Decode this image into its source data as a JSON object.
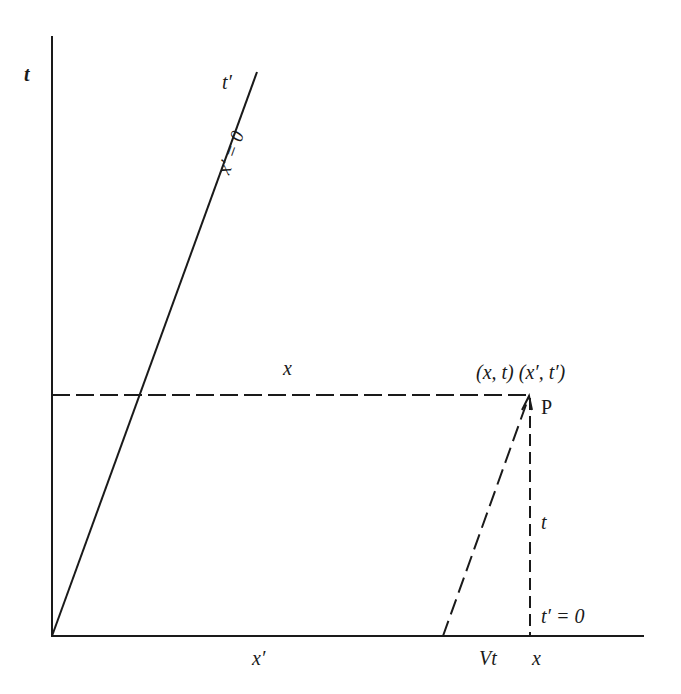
{
  "diagram": {
    "type": "spacetime-diagram",
    "colors": {
      "line": "#1a1a1a",
      "background": "#ffffff"
    },
    "axes": {
      "t_axis_label": "t",
      "x_prime_axis_label": "x′"
    },
    "worldline": {
      "top_label": "t′",
      "line_label": "x′ = 0"
    },
    "labels": {
      "horizontal_dashed": "x",
      "event_coords": "(x, t) (x′, t′)",
      "event_point": "P",
      "vertical_dashed": "t",
      "t_prime_zero": "t′ = 0",
      "vt": "Vt",
      "x_bottom": "x"
    }
  }
}
